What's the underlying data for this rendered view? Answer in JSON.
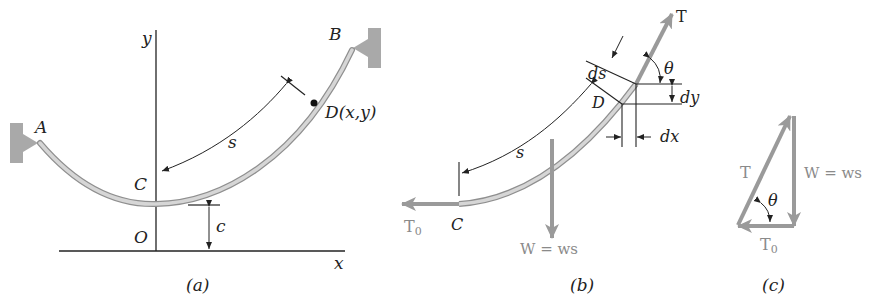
{
  "figure": {
    "panel_a": {
      "caption": "(a)",
      "labels": {
        "y_axis": "y",
        "x_axis": "x",
        "A": "A",
        "B": "B",
        "C": "C",
        "O": "O",
        "D": "D(x,y)",
        "s": "s",
        "c": "c"
      }
    },
    "panel_b": {
      "caption": "(b)",
      "labels": {
        "T": "T",
        "theta": "θ",
        "ds": "ds",
        "dy": "dy",
        "dx": "dx",
        "D": "D",
        "s": "s",
        "T0": "T",
        "T0_sub": "0",
        "C": "C",
        "W": "W = ws"
      }
    },
    "panel_c": {
      "caption": "(c)",
      "labels": {
        "T": "T",
        "theta": "θ",
        "W": "W = ws",
        "T0": "T",
        "T0_sub": "0"
      }
    },
    "colors": {
      "cable": "#c8c8c8",
      "cable_edge": "#8f8f8f",
      "force_arrow": "#9a9a9a",
      "support": "#a9a9a9",
      "line": "#222222"
    }
  }
}
